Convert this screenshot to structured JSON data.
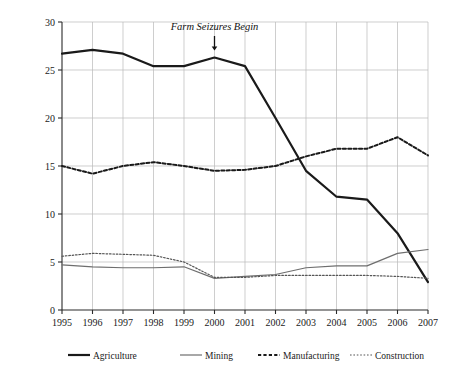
{
  "chart_data": {
    "type": "line",
    "title": "",
    "xlabel": "",
    "ylabel": "Formal National Employment (%)",
    "x": [
      1995,
      1996,
      1997,
      1998,
      1999,
      2000,
      2001,
      2002,
      2003,
      2004,
      2005,
      2006,
      2007
    ],
    "xtick_labels": [
      "1995",
      "1996",
      "1997",
      "1998",
      "1999",
      "2000",
      "2001",
      "2002",
      "2003",
      "2004",
      "2005",
      "2006",
      "2007"
    ],
    "ytick_labels": [
      "0",
      "5",
      "10",
      "15",
      "20",
      "25",
      "30"
    ],
    "ytick_values": [
      0,
      5,
      10,
      15,
      20,
      25,
      30
    ],
    "xlim": [
      1995,
      2007
    ],
    "ylim": [
      0,
      30
    ],
    "grid": true,
    "legend_position": "bottom",
    "series": [
      {
        "name": "Agriculture",
        "style": "solid-thick",
        "color": "#1a1a1a",
        "values": [
          26.7,
          27.1,
          26.7,
          25.4,
          25.4,
          26.3,
          25.4,
          20.0,
          14.5,
          11.8,
          11.5,
          8.0,
          2.9
        ]
      },
      {
        "name": "Mining",
        "style": "solid-thin",
        "color": "#6e6e6e",
        "values": [
          4.7,
          4.5,
          4.4,
          4.4,
          4.5,
          3.3,
          3.5,
          3.7,
          4.4,
          4.6,
          4.6,
          5.9,
          6.3
        ]
      },
      {
        "name": "Manufacturing",
        "style": "dashed-thick",
        "color": "#1a1a1a",
        "values": [
          15.0,
          14.2,
          15.0,
          15.4,
          15.0,
          14.5,
          14.6,
          15.0,
          16.0,
          16.8,
          16.8,
          18.0,
          16.1
        ]
      },
      {
        "name": "Construction",
        "style": "dotted-thin",
        "color": "#555555",
        "values": [
          5.6,
          5.9,
          5.8,
          5.7,
          5.0,
          3.4,
          3.4,
          3.6,
          3.6,
          3.6,
          3.6,
          3.5,
          3.3
        ]
      }
    ],
    "annotations": [
      {
        "text": "Farm Seizures Begin",
        "x": 2000,
        "y": 26.3,
        "marker": "down-arrow"
      }
    ]
  },
  "legend": {
    "items": [
      {
        "label": "Agriculture"
      },
      {
        "label": "Mining"
      },
      {
        "label": "Manufacturing"
      },
      {
        "label": "Construction"
      }
    ]
  },
  "colors": {
    "axis": "#2a2a2a",
    "grid": "#b9b9b9",
    "agriculture": "#1a1a1a",
    "mining": "#6e6e6e",
    "manufacturing": "#1a1a1a",
    "construction": "#555555",
    "background": "#ffffff"
  }
}
